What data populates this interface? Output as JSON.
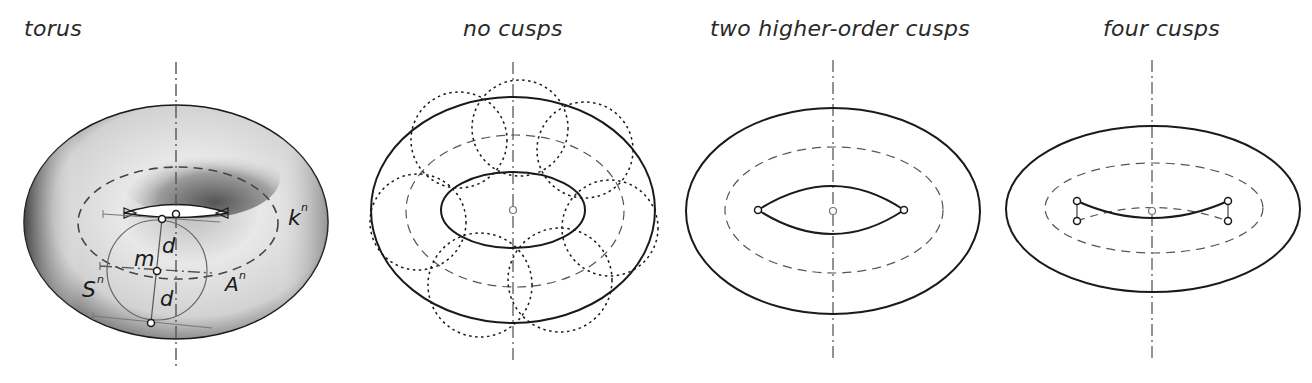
{
  "figure": {
    "panels": [
      {
        "id": "torus",
        "title": "torus",
        "labels": {
          "k": "k",
          "k_sup": "n",
          "A": "A",
          "A_sup": "n",
          "S": "S",
          "S_sup": "n",
          "m": "m",
          "d_upper": "d",
          "d_lower": "d"
        }
      },
      {
        "id": "no-cusps",
        "title": "no cusps",
        "dotted_circle_count": 8
      },
      {
        "id": "two-cusps",
        "title": "two higher-order cusps",
        "cusp_count": 2
      },
      {
        "id": "four-cusps",
        "title": "four cusps",
        "cusp_count": 4
      }
    ],
    "colors": {
      "outline": "#1a1a1a",
      "dashed": "#555555",
      "axis": "#666666",
      "shade_dark": "#3a3a3a",
      "shade_light": "#f2f2f2"
    }
  }
}
